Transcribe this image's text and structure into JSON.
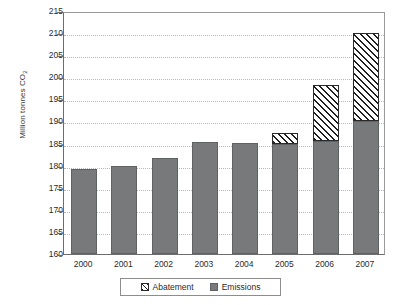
{
  "chart_data": {
    "type": "bar",
    "subtype": "stacked-bar",
    "title": "",
    "xlabel": "",
    "ylabel": "Million tonnes CO2",
    "ylabel_display": "Million tonnes CO",
    "ylabel_sub": "2",
    "categories": [
      "2000",
      "2001",
      "2002",
      "2003",
      "2004",
      "2005",
      "2006",
      "2007"
    ],
    "ylim": [
      160,
      215
    ],
    "yticks": [
      160,
      165,
      170,
      175,
      180,
      185,
      190,
      195,
      200,
      205,
      210,
      215
    ],
    "ytick_labels": [
      "160",
      "165",
      "170",
      "175",
      "180",
      "185",
      "190",
      "195",
      "200",
      "205",
      "210",
      "215"
    ],
    "grid": true,
    "grid_axis": "y",
    "legend_position": "bottom",
    "series": [
      {
        "name": "Emissions",
        "style": "solid",
        "color": "#77797a",
        "values": [
          179.3,
          180.0,
          181.8,
          185.4,
          185.2,
          184.8,
          185.5,
          190.0
        ]
      },
      {
        "name": "Abatement",
        "style": "hatched",
        "color": "#ffffff",
        "hatch": "diagonal-lines",
        "values": [
          0,
          0,
          0,
          0,
          0,
          2.7,
          12.8,
          20.0
        ]
      }
    ],
    "stack_totals": [
      179.3,
      180.0,
      181.8,
      185.4,
      185.2,
      187.5,
      198.3,
      210.0
    ]
  },
  "legend": {
    "items": [
      {
        "label": "Abatement",
        "swatch": "hatched-swatch"
      },
      {
        "label": "Emissions",
        "swatch": "solid-gray-swatch"
      }
    ]
  }
}
